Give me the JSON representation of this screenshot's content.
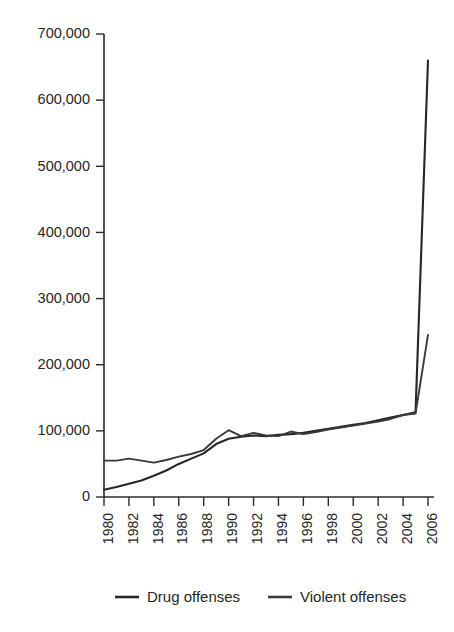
{
  "chart_data": {
    "type": "line",
    "title": "",
    "subtitle": "",
    "xlabel": "",
    "ylabel": "",
    "x": [
      1980,
      1981,
      1982,
      1983,
      1984,
      1985,
      1986,
      1987,
      1988,
      1989,
      1990,
      1991,
      1992,
      1993,
      1994,
      1995,
      1996,
      1997,
      1998,
      1999,
      2000,
      2001,
      2002,
      2003,
      2004,
      2005,
      2006
    ],
    "xlim": [
      1980,
      2006
    ],
    "ylim": [
      0,
      700000
    ],
    "grid": false,
    "legend_position": "bottom",
    "y_ticks": [
      0,
      100000,
      200000,
      300000,
      400000,
      500000,
      600000,
      700000
    ],
    "y_tick_labels": [
      "0",
      "100,000",
      "200,000",
      "300,000",
      "400,000",
      "500,000",
      "600,000",
      "700,000"
    ],
    "x_ticks": [
      1980,
      1982,
      1984,
      1986,
      1988,
      1990,
      1992,
      1994,
      1996,
      1998,
      2000,
      2002,
      2004,
      2006
    ],
    "x_tick_labels": [
      "1980",
      "1982",
      "1984",
      "1986",
      "1988",
      "1990",
      "1992",
      "1994",
      "1996",
      "1998",
      "2000",
      "2002",
      "2004",
      "2006"
    ],
    "series": [
      {
        "name": "Drug offenses",
        "color": "#262626",
        "values": [
          11000,
          15000,
          20000,
          25000,
          32000,
          40000,
          50000,
          58000,
          66000,
          80000,
          88000,
          91000,
          93000,
          92000,
          94000,
          95000,
          97000,
          100000,
          103000,
          106000,
          109000,
          112000,
          116000,
          120000,
          124000,
          128000,
          660000
        ]
      },
      {
        "name": "Violent offenses",
        "color": "#3a3a3a",
        "values": [
          55000,
          55000,
          58000,
          55000,
          52000,
          56000,
          61000,
          65000,
          71000,
          88000,
          101000,
          92000,
          97000,
          93000,
          92000,
          99000,
          95000,
          98000,
          102000,
          105000,
          108000,
          111000,
          114000,
          118000,
          124000,
          126000,
          245000
        ]
      }
    ]
  },
  "legend": {
    "items": [
      {
        "label": "Drug offenses"
      },
      {
        "label": "Violent offenses"
      }
    ]
  }
}
